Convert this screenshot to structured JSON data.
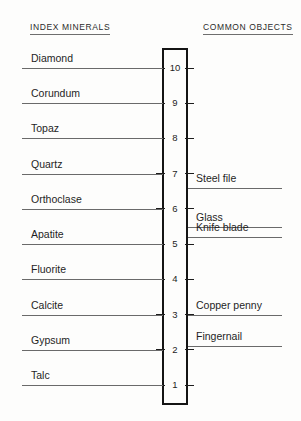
{
  "headers": {
    "left": "INDEX MINERALS",
    "right": "COMMON OBJECTS"
  },
  "scale": {
    "min": 1,
    "max": 10,
    "ticks": [
      "10",
      "9",
      "8",
      "7",
      "6",
      "5",
      "4",
      "3",
      "2",
      "1"
    ]
  },
  "colors": {
    "line": "#6a6a6a",
    "box": "#141414",
    "text": "#1f1f1f",
    "background": "#fdfdfc"
  },
  "chart_data": {
    "type": "scatter",
    "title": "INDEX MINERALS",
    "xlabel": "",
    "ylabel": "Mohs hardness",
    "ylim": [
      1,
      10
    ],
    "grid": false,
    "legend": "none",
    "series": [
      {
        "name": "INDEX MINERALS",
        "side": "left",
        "points": [
          {
            "label": "Diamond",
            "value": 10
          },
          {
            "label": "Corundum",
            "value": 9
          },
          {
            "label": "Topaz",
            "value": 8
          },
          {
            "label": "Quartz",
            "value": 7
          },
          {
            "label": "Orthoclase",
            "value": 6
          },
          {
            "label": "Apatite",
            "value": 5
          },
          {
            "label": "Fluorite",
            "value": 4
          },
          {
            "label": "Calcite",
            "value": 3
          },
          {
            "label": "Gypsum",
            "value": 2
          },
          {
            "label": "Talc",
            "value": 1
          }
        ]
      },
      {
        "name": "COMMON OBJECTS",
        "side": "right",
        "points": [
          {
            "label": "Steel file",
            "value": 6.6
          },
          {
            "label": "Glass",
            "value": 5.5
          },
          {
            "label": "Knife blade",
            "value": 5.2
          },
          {
            "label": "Copper penny",
            "value": 3.0
          },
          {
            "label": "Fingernail",
            "value": 2.1
          }
        ]
      }
    ]
  }
}
